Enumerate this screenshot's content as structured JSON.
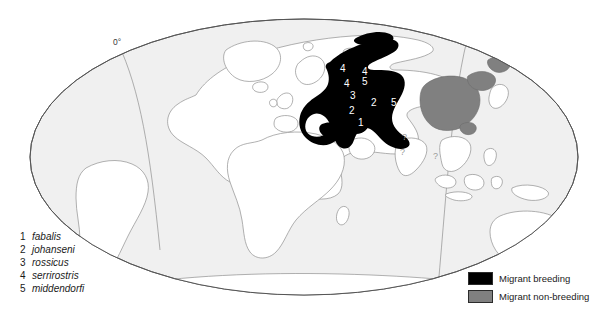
{
  "figure": {
    "projection": "Mollweide-style elliptical world map",
    "meridian_label": "0°"
  },
  "colors": {
    "ocean": "#f0f0f0",
    "land": "#ffffff",
    "coastline": "#8c8c8c",
    "outline": "#555555",
    "breeding": "#000000",
    "non_breeding": "#808080",
    "text": "#1a1a1a"
  },
  "species_legend": {
    "items": [
      {
        "num": "1",
        "name": "fabalis"
      },
      {
        "num": "2",
        "name": "johanseni"
      },
      {
        "num": "3",
        "name": "rossicus"
      },
      {
        "num": "4",
        "name": "serrirostris"
      },
      {
        "num": "5",
        "name": "middendorfi"
      }
    ]
  },
  "class_legend": {
    "items": [
      {
        "label": "Migrant breeding",
        "color": "#000000"
      },
      {
        "label": "Migrant non-breeding",
        "color": "#808080"
      }
    ]
  },
  "map_annotations": {
    "numbers": [
      {
        "value": "4",
        "x": 340,
        "y": 69
      },
      {
        "value": "4",
        "x": 362,
        "y": 72
      },
      {
        "value": "5",
        "x": 362,
        "y": 82
      },
      {
        "value": "4",
        "x": 346,
        "y": 83
      },
      {
        "value": "3",
        "x": 352,
        "y": 95
      },
      {
        "value": "2",
        "x": 372,
        "y": 102
      },
      {
        "value": "5",
        "x": 391,
        "y": 102
      },
      {
        "value": "2",
        "x": 350,
        "y": 110
      },
      {
        "value": "1",
        "x": 359,
        "y": 122
      }
    ],
    "question_marks": [
      {
        "value": "?",
        "x": 402,
        "y": 133
      },
      {
        "value": "?",
        "x": 400,
        "y": 148
      },
      {
        "value": "?",
        "x": 433,
        "y": 152
      }
    ]
  }
}
